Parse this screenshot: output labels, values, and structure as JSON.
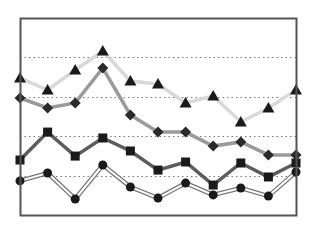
{
  "chart_data": {
    "type": "line",
    "title": "",
    "xlabel": "",
    "ylabel": "",
    "ylim": [
      0,
      100
    ],
    "grid": {
      "horizontal": true,
      "style": "dotted",
      "values": [
        20,
        40,
        60,
        80
      ]
    },
    "legend": null,
    "x": [
      1,
      2,
      3,
      4,
      5,
      6,
      7,
      8,
      9,
      10,
      11
    ],
    "series": [
      {
        "name": "Series A (triangles)",
        "marker": "triangle",
        "line_color": "#d9d9d9",
        "marker_color": "#1a1a1a",
        "line_style": "solid",
        "values": [
          69.5,
          63.5,
          73.6,
          83.2,
          68.0,
          66.5,
          56.9,
          60.4,
          47.2,
          54.3,
          63.5
        ]
      },
      {
        "name": "Series B (diamonds)",
        "marker": "diamond",
        "line_color": "#9a9a9a",
        "marker_color": "#2a2a2a",
        "line_style": "solid",
        "values": [
          59.4,
          54.3,
          56.9,
          74.6,
          50.8,
          42.1,
          42.1,
          35.0,
          37.1,
          30.5,
          30.5
        ]
      },
      {
        "name": "Series C (squares)",
        "marker": "square",
        "line_color": "#5c5c5c",
        "marker_color": "#1a1a1a",
        "line_style": "solid",
        "values": [
          27.9,
          42.1,
          29.9,
          39.1,
          32.5,
          22.8,
          26.9,
          15.2,
          26.4,
          19.3,
          26.4
        ]
      },
      {
        "name": "Series D (circles)",
        "marker": "circle",
        "line_color": "#ffffff",
        "line_outline": "#777777",
        "marker_color": "#1a1a1a",
        "line_style": "double",
        "values": [
          17.3,
          21.3,
          8.1,
          25.4,
          14.2,
          8.6,
          16.2,
          10.2,
          13.7,
          9.6,
          21.8
        ]
      }
    ]
  },
  "layout": {
    "frame": {
      "left": 20,
      "top": 18,
      "right": 296,
      "bottom": 215
    },
    "frame_color": "#555555",
    "grid_color": "#7a7a7a"
  }
}
